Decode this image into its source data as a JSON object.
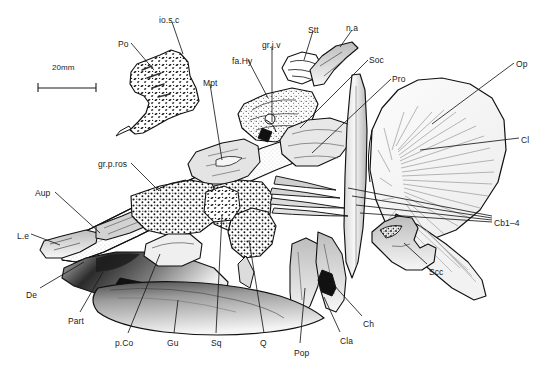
{
  "figure": {
    "kind": "anatomical-line-drawing",
    "background_color": "#ffffff",
    "ink_color": "#1a1a1a",
    "width": 546,
    "height": 371
  },
  "scale_bar": {
    "label": "20mm",
    "x": 38,
    "y": 88,
    "length": 58,
    "text_x": 52,
    "text_y": 70
  },
  "labels": [
    {
      "id": "io-s-c",
      "text": "io.s.c",
      "x": 159,
      "y": 16,
      "anchor": "start"
    },
    {
      "id": "po",
      "text": "Po",
      "x": 118,
      "y": 40,
      "anchor": "start"
    },
    {
      "id": "fa-hy",
      "text": "fa.Hy",
      "x": 232,
      "y": 57,
      "anchor": "start"
    },
    {
      "id": "gr-j-v",
      "text": "gr.j.v",
      "x": 262,
      "y": 41,
      "anchor": "start"
    },
    {
      "id": "stt",
      "text": "Stt",
      "x": 308,
      "y": 26,
      "anchor": "start"
    },
    {
      "id": "n-a",
      "text": "n.a",
      "x": 346,
      "y": 24,
      "anchor": "start"
    },
    {
      "id": "soc",
      "text": "Soc",
      "x": 369,
      "y": 56,
      "anchor": "start"
    },
    {
      "id": "pro",
      "text": "Pro",
      "x": 392,
      "y": 75,
      "anchor": "start"
    },
    {
      "id": "op",
      "text": "Op",
      "x": 516,
      "y": 60,
      "anchor": "start"
    },
    {
      "id": "cl",
      "text": "Cl",
      "x": 521,
      "y": 136,
      "anchor": "start"
    },
    {
      "id": "mpt",
      "text": "Mpt",
      "x": 203,
      "y": 79,
      "anchor": "start"
    },
    {
      "id": "gr-p-ros",
      "text": "gr.p.ros",
      "x": 98,
      "y": 160,
      "anchor": "start"
    },
    {
      "id": "aup",
      "text": "Aup",
      "x": 35,
      "y": 189,
      "anchor": "start"
    },
    {
      "id": "l-e",
      "text": "L.e",
      "x": 17,
      "y": 232,
      "anchor": "start"
    },
    {
      "id": "de",
      "text": "De",
      "x": 26,
      "y": 291,
      "anchor": "start"
    },
    {
      "id": "part",
      "text": "Part",
      "x": 68,
      "y": 317,
      "anchor": "start"
    },
    {
      "id": "p-co",
      "text": "p.Co",
      "x": 115,
      "y": 339,
      "anchor": "start"
    },
    {
      "id": "gu",
      "text": "Gu",
      "x": 167,
      "y": 339,
      "anchor": "start"
    },
    {
      "id": "sq",
      "text": "Sq",
      "x": 211,
      "y": 339,
      "anchor": "start"
    },
    {
      "id": "q",
      "text": "Q",
      "x": 260,
      "y": 339,
      "anchor": "start"
    },
    {
      "id": "pop",
      "text": "Pop",
      "x": 294,
      "y": 349,
      "anchor": "start"
    },
    {
      "id": "cla",
      "text": "Cla",
      "x": 340,
      "y": 337,
      "anchor": "start"
    },
    {
      "id": "ch",
      "text": "Ch",
      "x": 363,
      "y": 320,
      "anchor": "start"
    },
    {
      "id": "scc",
      "text": "Scc",
      "x": 429,
      "y": 268,
      "anchor": "start"
    },
    {
      "id": "cb1-4",
      "text": "Cb1–4",
      "x": 494,
      "y": 219,
      "anchor": "start"
    }
  ],
  "leader_lines": [
    {
      "id": "io-s-c",
      "x1": 172,
      "y1": 22,
      "x2": 183,
      "y2": 54
    },
    {
      "id": "po",
      "x1": 131,
      "y1": 43,
      "x2": 154,
      "y2": 70
    },
    {
      "id": "fa-hy",
      "x1": 248,
      "y1": 60,
      "x2": 268,
      "y2": 98
    },
    {
      "id": "gr-j-v",
      "x1": 272,
      "y1": 46,
      "x2": 272,
      "y2": 122
    },
    {
      "id": "stt",
      "x1": 313,
      "y1": 31,
      "x2": 304,
      "y2": 60
    },
    {
      "id": "n-a",
      "x1": 352,
      "y1": 30,
      "x2": 340,
      "y2": 47
    },
    {
      "id": "soc",
      "x1": 368,
      "y1": 60,
      "x2": 300,
      "y2": 128
    },
    {
      "id": "pro",
      "x1": 391,
      "y1": 79,
      "x2": 312,
      "y2": 153
    },
    {
      "id": "op",
      "x1": 514,
      "y1": 63,
      "x2": 432,
      "y2": 124
    },
    {
      "id": "cl",
      "x1": 519,
      "y1": 138,
      "x2": 420,
      "y2": 150
    },
    {
      "id": "mpt",
      "x1": 210,
      "y1": 84,
      "x2": 222,
      "y2": 160
    },
    {
      "id": "gr-p-ros",
      "x1": 131,
      "y1": 163,
      "x2": 159,
      "y2": 191
    },
    {
      "id": "aup",
      "x1": 55,
      "y1": 192,
      "x2": 100,
      "y2": 233
    },
    {
      "id": "l-e",
      "x1": 31,
      "y1": 234,
      "x2": 60,
      "y2": 245
    },
    {
      "id": "de",
      "x1": 40,
      "y1": 288,
      "x2": 84,
      "y2": 262
    },
    {
      "id": "part",
      "x1": 80,
      "y1": 312,
      "x2": 103,
      "y2": 272
    },
    {
      "id": "p-co",
      "x1": 128,
      "y1": 333,
      "x2": 160,
      "y2": 254
    },
    {
      "id": "gu",
      "x1": 174,
      "y1": 333,
      "x2": 178,
      "y2": 300
    },
    {
      "id": "sq",
      "x1": 216,
      "y1": 333,
      "x2": 222,
      "y2": 215
    },
    {
      "id": "q",
      "x1": 264,
      "y1": 333,
      "x2": 249,
      "y2": 240
    },
    {
      "id": "pop",
      "x1": 300,
      "y1": 343,
      "x2": 305,
      "y2": 288
    },
    {
      "id": "cla",
      "x1": 340,
      "y1": 332,
      "x2": 324,
      "y2": 297
    },
    {
      "id": "ch",
      "x1": 362,
      "y1": 316,
      "x2": 332,
      "y2": 283
    },
    {
      "id": "scc",
      "x1": 427,
      "y1": 264,
      "x2": 404,
      "y2": 243
    },
    {
      "id": "cb1-4a",
      "x1": 492,
      "y1": 216,
      "x2": 348,
      "y2": 188
    },
    {
      "id": "cb1-4b",
      "x1": 492,
      "y1": 218,
      "x2": 352,
      "y2": 196
    },
    {
      "id": "cb1-4c",
      "x1": 492,
      "y1": 220,
      "x2": 356,
      "y2": 205
    },
    {
      "id": "cb1-4d",
      "x1": 492,
      "y1": 222,
      "x2": 360,
      "y2": 213
    }
  ]
}
